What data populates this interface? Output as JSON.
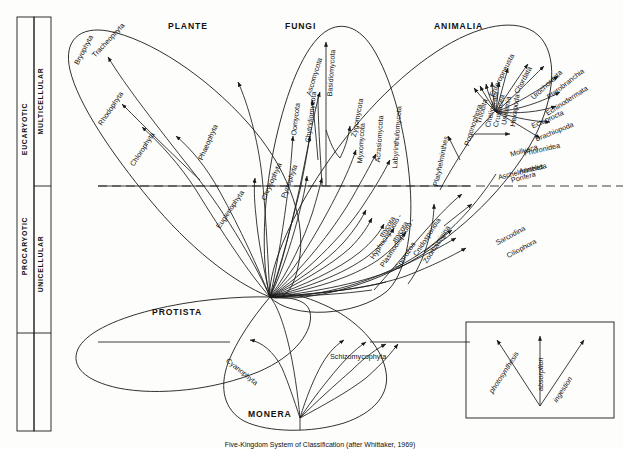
{
  "figure": {
    "caption": "Five-Kingdom System of Classification (after Whittaker, 1969)"
  },
  "axis": {
    "procaryotic": "PROCARYOTIC",
    "eucaryotic": "EUCARYOTIC",
    "unicellular": "UNICELLULAR",
    "multicellular": "MULTICELLULAR"
  },
  "kingdoms": {
    "plantae": "PLANTE",
    "fungi": "FUNGI",
    "animalia": "ANIMALIA",
    "protista": "PROTISTA",
    "monera": "MONERA"
  },
  "legend": {
    "photosynthesis": "photosynthesis",
    "absorption": "absorption",
    "ingestion": "ingestion"
  },
  "taxa": {
    "plantae": [
      {
        "name": "Tracheophyta"
      },
      {
        "name": "Bryophyta"
      },
      {
        "name": "Rhodophyta"
      },
      {
        "name": "Chlorophyta"
      },
      {
        "name": "Phaeophyta"
      }
    ],
    "fungi": [
      {
        "name": "Oomycota"
      },
      {
        "name": "Chytridiomycota"
      },
      {
        "name": "Ascomycota"
      },
      {
        "name": "Basidiomycota"
      },
      {
        "name": "Zygomycota"
      },
      {
        "name": "Myxomycota"
      },
      {
        "name": "Acrasiomycota"
      },
      {
        "name": "Labyrinthulomycota"
      }
    ],
    "animalia": [
      {
        "name": "Platyhelminthes"
      },
      {
        "name": "Pogonophora"
      },
      {
        "name": "Trilobita"
      },
      {
        "name": "Chelicerata"
      },
      {
        "name": "Crustacea"
      },
      {
        "name": "Uniramia"
      },
      {
        "name": "Hexapoda"
      },
      {
        "name": "Enteropneusta"
      },
      {
        "name": "Chordata"
      },
      {
        "name": "Urochordata"
      },
      {
        "name": "Pterobranchia"
      },
      {
        "name": "Echinodermata"
      },
      {
        "name": "Ectoprocta"
      },
      {
        "name": "Brachiopoda"
      },
      {
        "name": "Phoronidea"
      },
      {
        "name": "Annelida"
      },
      {
        "name": "Mollusca"
      },
      {
        "name": "Aschelminthes"
      },
      {
        "name": "Porifera"
      }
    ],
    "protista": [
      {
        "name": "Euglenophyta"
      },
      {
        "name": "Chrysophyta"
      },
      {
        "name": "Pyrrophyta"
      },
      {
        "name": "Hyphochytridio -"
      },
      {
        "name": "mycota"
      },
      {
        "name": "Plasmodiophoro -"
      },
      {
        "name": "mycota"
      },
      {
        "name": "Sporozoa"
      },
      {
        "name": "Cnidosporidia"
      },
      {
        "name": "Zoomastigina"
      },
      {
        "name": "Sarcodina"
      },
      {
        "name": "Ciliophora"
      }
    ],
    "monera": [
      {
        "name": "Cyanophyta"
      },
      {
        "name": "Schizomycophyta"
      }
    ]
  },
  "colors": {
    "ink": "#1a1a1a",
    "background": "#fdfdfc"
  }
}
